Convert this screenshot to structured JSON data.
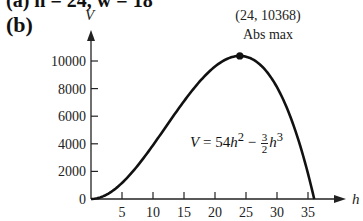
{
  "figure": {
    "top_cut_text": "(a)  h = 24,  w = 18",
    "panel_label": "(b)",
    "annotation": {
      "point": "(24, 10368)",
      "label": "Abs max"
    },
    "equation": {
      "lhs": "V",
      "eq": " = 54",
      "h1": "h",
      "exp1": "2",
      "minus": " − ",
      "num": "3",
      "den": "2",
      "h2": "h",
      "exp2": "3"
    }
  },
  "chart_data": {
    "type": "line",
    "title": "",
    "xlabel": "h",
    "ylabel": "V",
    "function": "V = 54h^2 - (3/2)h^3",
    "xlim": [
      0,
      37
    ],
    "ylim": [
      0,
      10800
    ],
    "xticks": [
      5,
      10,
      15,
      20,
      25,
      30,
      35
    ],
    "yticks": [
      0,
      2000,
      4000,
      6000,
      8000,
      10000
    ],
    "grid": false,
    "legend": "none",
    "series": [
      {
        "name": "V = 54h² − (3/2)h³",
        "x": [
          0,
          2,
          4,
          6,
          8,
          10,
          12,
          14,
          16,
          18,
          20,
          22,
          24,
          26,
          28,
          30,
          32,
          34,
          36
        ],
        "y": [
          0,
          204,
          768,
          1620,
          2688,
          3900,
          5184,
          6468,
          7680,
          8748,
          9600,
          10164,
          10368,
          10140,
          9408,
          8100,
          6144,
          3468,
          0
        ]
      }
    ],
    "annotations": [
      {
        "x": 24,
        "y": 10368,
        "text": "(24, 10368)",
        "subtext": "Abs max",
        "marker": "filled-circle"
      }
    ]
  },
  "axes": {
    "x_ticks": [
      "5",
      "10",
      "15",
      "20",
      "25",
      "30",
      "35"
    ],
    "y_ticks": [
      "0",
      "2000",
      "4000",
      "6000",
      "8000",
      "10000"
    ],
    "x_label": "h",
    "y_label": "V"
  }
}
